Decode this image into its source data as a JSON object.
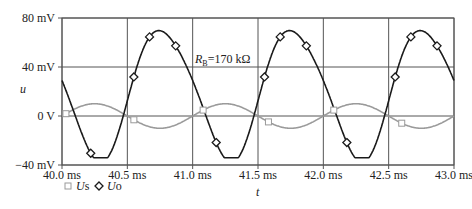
{
  "chart_data": {
    "type": "line",
    "title": "",
    "xlabel": "t",
    "ylabel": "u",
    "x_unit": "ms",
    "xlim": [
      40.0,
      43.0
    ],
    "ylim": [
      -40,
      80
    ],
    "y_unit": "mV",
    "x_ticks": [
      "40.0 ms",
      "40.5 ms",
      "41.0 ms",
      "41.5 ms",
      "42.0 ms",
      "42.5 ms",
      "43.0 ms"
    ],
    "y_ticks": [
      {
        "value": 80,
        "label": "80 mV"
      },
      {
        "value": 40,
        "label": "40 mV"
      },
      {
        "value": 0,
        "label": "0 V"
      },
      {
        "value": -40,
        "label": "-40 mV"
      }
    ],
    "grid": true,
    "annotations": [
      {
        "text_main": "R",
        "text_sub": "B",
        "text_rest": "=170 kΩ",
        "x": 41.0,
        "y": 43
      }
    ],
    "legend": {
      "position": "bottom-left",
      "entries": [
        {
          "name": "Us",
          "marker": "square",
          "color": "#999999"
        },
        {
          "name": "Uo",
          "marker": "diamond",
          "color": "#1a1a1a"
        }
      ]
    },
    "series": [
      {
        "name": "Us",
        "color": "#999999",
        "marker": "square",
        "description": "sine, amplitude ~10 mV, period 1.0 ms, zero crossings ~40.0/40.5 ms",
        "amplitude_mV": 10,
        "offset_mV": 0,
        "period_ms": 1.0,
        "phase_ms": 40.0,
        "marker_x": [
          40.03,
          40.55,
          41.08,
          41.58,
          42.08,
          42.6
        ]
      },
      {
        "name": "Uo",
        "color": "#1a1a1a",
        "marker": "diamond",
        "description": "inverted amplified sine with DC offset; peak ~72 mV, trough ~-34 mV, period 1.0 ms",
        "peak_mV": 72,
        "trough_mV": -34,
        "period_ms": 1.0,
        "peaks_ms": [
          40.72,
          41.72,
          42.72
        ],
        "troughs_ms": [
          40.25,
          41.25,
          42.25
        ],
        "marker_x": [
          40.22,
          40.55,
          40.67,
          40.87,
          41.18,
          41.55,
          41.67,
          41.87,
          42.18,
          42.55,
          42.67,
          42.87
        ]
      }
    ]
  },
  "labels": {
    "y_axis": "u",
    "x_axis": "t",
    "annotation_R": "R",
    "annotation_sub": "B",
    "annotation_rest": "=170 kΩ",
    "legend_us_italic": "U",
    "legend_us_rest": "s",
    "legend_uo_italic": "U",
    "legend_uo_rest": "o"
  },
  "colors": {
    "uo": "#1a1a1a",
    "us": "#9a9a9a",
    "grid": "#555555"
  }
}
